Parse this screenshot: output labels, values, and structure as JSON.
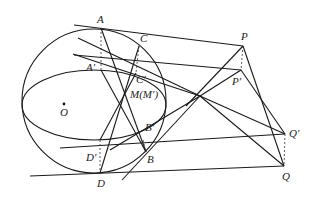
{
  "diagram": {
    "type": "geometry",
    "circle": {
      "cx": 94,
      "cy": 101,
      "r": 72
    },
    "ellipse": {
      "cx": 94,
      "cy": 105,
      "rx": 72,
      "ry": 35
    },
    "points": {
      "A": {
        "label": "A",
        "x": 101,
        "y": 28
      },
      "A_prime": {
        "label": "A′",
        "x": 101,
        "y": 70
      },
      "C": {
        "label": "C",
        "x": 139,
        "y": 46
      },
      "C_prime": {
        "label": "C′",
        "x": 136,
        "y": 73
      },
      "M": {
        "label": "M(M′)",
        "x": 125,
        "y": 92
      },
      "O": {
        "label": "O",
        "x": 64,
        "y": 103
      },
      "B_prime": {
        "label": "B′",
        "x": 143,
        "y": 140
      },
      "B": {
        "label": "B",
        "x": 146,
        "y": 152
      },
      "D_prime": {
        "label": "D′",
        "x": 100,
        "y": 140
      },
      "D": {
        "label": "D",
        "x": 100,
        "y": 173
      },
      "P": {
        "label": "P",
        "x": 243,
        "y": 46
      },
      "P_prime": {
        "label": "P′",
        "x": 241,
        "y": 70
      },
      "Q_prime": {
        "label": "Q′",
        "x": 285,
        "y": 134
      },
      "Q": {
        "label": "Q",
        "x": 284,
        "y": 166
      },
      "X": {
        "label": "",
        "x": 200,
        "y": 96
      }
    }
  }
}
